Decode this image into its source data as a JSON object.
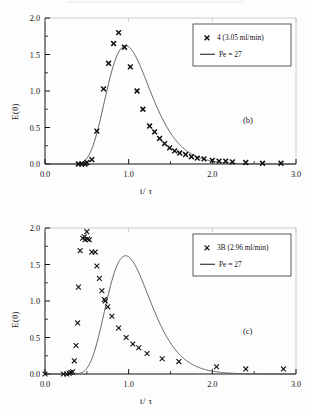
{
  "figure": {
    "background": "#ffffff",
    "ink_color": "#111111",
    "curve_color": "#555555"
  },
  "chart_data": [
    {
      "type": "scatter",
      "panel_label": "(b)",
      "title": "",
      "xlabel": "t/ τ",
      "ylabel": "E(θ)",
      "xlim": [
        0.0,
        3.0
      ],
      "ylim": [
        0.0,
        2.0
      ],
      "xticks": [
        "0.0",
        "1.0",
        "2.0",
        "3.0"
      ],
      "xtick_values": [
        0.0,
        1.0,
        2.0,
        3.0
      ],
      "yticks": [
        "0.0",
        "0.5",
        "1.0",
        "1.5",
        "2.0"
      ],
      "ytick_values": [
        0.0,
        0.5,
        1.0,
        1.5,
        2.0
      ],
      "grid": false,
      "legend_position": "upper right",
      "series": [
        {
          "name": "4 (3.05 ml/min)",
          "marker": "x",
          "kind": "scatter",
          "points": [
            [
              0.4,
              0.0
            ],
            [
              0.44,
              0.0
            ],
            [
              0.48,
              0.0
            ],
            [
              0.5,
              0.02
            ],
            [
              0.56,
              0.06
            ],
            [
              0.62,
              0.45
            ],
            [
              0.7,
              1.03
            ],
            [
              0.76,
              1.38
            ],
            [
              0.82,
              1.65
            ],
            [
              0.88,
              1.8
            ],
            [
              0.95,
              1.6
            ],
            [
              1.02,
              1.33
            ],
            [
              1.1,
              1.0
            ],
            [
              1.17,
              0.75
            ],
            [
              1.25,
              0.52
            ],
            [
              1.31,
              0.44
            ],
            [
              1.37,
              0.35
            ],
            [
              1.43,
              0.28
            ],
            [
              1.49,
              0.22
            ],
            [
              1.55,
              0.18
            ],
            [
              1.61,
              0.15
            ],
            [
              1.68,
              0.13
            ],
            [
              1.75,
              0.1
            ],
            [
              1.82,
              0.08
            ],
            [
              1.9,
              0.07
            ],
            [
              2.0,
              0.05
            ],
            [
              2.08,
              0.04
            ],
            [
              2.16,
              0.04
            ],
            [
              2.24,
              0.03
            ],
            [
              2.4,
              0.02
            ],
            [
              2.6,
              0.01
            ],
            [
              2.82,
              0.01
            ]
          ]
        },
        {
          "name": "Pe = 27",
          "marker": "line",
          "kind": "model",
          "model": {
            "peclet": 27,
            "peak_x": 0.9,
            "peak_y": 1.62
          }
        }
      ]
    },
    {
      "type": "scatter",
      "panel_label": "(c)",
      "title": "",
      "xlabel": "t/ τ",
      "ylabel": "E(θ)",
      "xlim": [
        0.0,
        3.0
      ],
      "ylim": [
        0.0,
        2.0
      ],
      "xticks": [
        "0.0",
        "1.0",
        "2.0",
        "3.0"
      ],
      "xtick_values": [
        0.0,
        1.0,
        2.0,
        3.0
      ],
      "yticks": [
        "0.0",
        "0.5",
        "1.0",
        "1.5",
        "2.0"
      ],
      "ytick_values": [
        0.0,
        0.5,
        1.0,
        1.5,
        2.0
      ],
      "grid": false,
      "legend_position": "upper right",
      "series": [
        {
          "name": "3B (2.96 ml/min)",
          "marker": "x",
          "kind": "scatter",
          "points": [
            [
              0.0,
              0.0
            ],
            [
              0.22,
              0.0
            ],
            [
              0.26,
              0.0
            ],
            [
              0.29,
              0.01
            ],
            [
              0.31,
              0.02
            ],
            [
              0.33,
              0.03
            ],
            [
              0.35,
              0.18
            ],
            [
              0.37,
              0.39
            ],
            [
              0.39,
              0.7
            ],
            [
              0.4,
              1.19
            ],
            [
              0.42,
              1.69
            ],
            [
              0.45,
              1.86
            ],
            [
              0.47,
              1.88
            ],
            [
              0.48,
              1.84
            ],
            [
              0.5,
              1.95
            ],
            [
              0.51,
              1.85
            ],
            [
              0.53,
              1.84
            ],
            [
              0.56,
              1.67
            ],
            [
              0.6,
              1.67
            ],
            [
              0.62,
              1.48
            ],
            [
              0.65,
              1.31
            ],
            [
              0.68,
              1.14
            ],
            [
              0.71,
              1.02
            ],
            [
              0.72,
              1.0
            ],
            [
              0.75,
              0.92
            ],
            [
              0.8,
              0.79
            ],
            [
              0.88,
              0.63
            ],
            [
              0.97,
              0.5
            ],
            [
              1.05,
              0.41
            ],
            [
              1.12,
              0.36
            ],
            [
              1.22,
              0.28
            ],
            [
              1.4,
              0.21
            ],
            [
              1.6,
              0.17
            ],
            [
              2.05,
              0.1
            ],
            [
              2.4,
              0.07
            ],
            [
              2.85,
              0.07
            ]
          ]
        },
        {
          "name": "Pe = 27",
          "marker": "line",
          "kind": "model",
          "model": {
            "peclet": 27,
            "peak_x": 0.9,
            "peak_y": 1.62
          }
        }
      ]
    }
  ]
}
